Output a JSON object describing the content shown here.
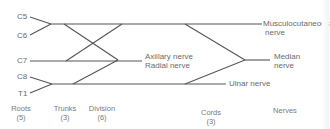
{
  "diagram": {
    "roots": [
      {
        "label": "C5"
      },
      {
        "label": "C6"
      },
      {
        "label": "C7"
      },
      {
        "label": "C8"
      },
      {
        "label": "T1"
      }
    ],
    "nerves": {
      "musculocutaneous_line1": "Musculocutaneous",
      "musculocutaneous_line2": "nerve",
      "axillary": "Axillary nerve",
      "radial": "Radial nerve",
      "median_line1": "Median",
      "median_line2": "nerve",
      "ulnar": "Ulnar nerve"
    },
    "columns": [
      {
        "label": "Roots",
        "count": "(5)"
      },
      {
        "label": "Trunks",
        "count": "(3)"
      },
      {
        "label": "Division",
        "count": "(6)"
      },
      {
        "label": "Cords",
        "count": "(3)"
      },
      {
        "label": "Nerves",
        "count": ""
      }
    ],
    "line_color": "#555555",
    "text_color": "#6a6a6a"
  }
}
